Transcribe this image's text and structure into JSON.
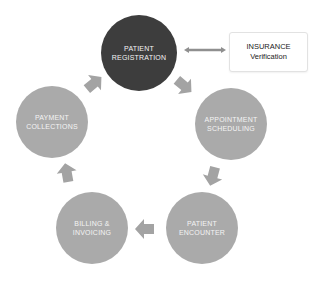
{
  "diagram": {
    "type": "cycle",
    "nodes": [
      {
        "id": "registration",
        "line1": "PATIENT",
        "line2": "REGISTRATION",
        "style": "dark",
        "color": "#3d3d3d"
      },
      {
        "id": "appointment",
        "line1": "APPOINTMENT",
        "line2": "SCHEDULING",
        "style": "light",
        "color": "#aaaaaa"
      },
      {
        "id": "encounter",
        "line1": "PATIENT",
        "line2": "ENCOUNTER",
        "style": "light",
        "color": "#aaaaaa"
      },
      {
        "id": "billing",
        "line1": "BILLING &",
        "line2": "INVOICING",
        "style": "light",
        "color": "#aaaaaa"
      },
      {
        "id": "payment",
        "line1": "PAYMENT",
        "line2": "COLLECTIONS",
        "style": "light",
        "color": "#aaaaaa"
      }
    ],
    "side_box": {
      "line1": "INSURANCE",
      "line2": "Verification"
    },
    "edges": [
      {
        "from": "registration",
        "to": "appointment"
      },
      {
        "from": "appointment",
        "to": "encounter"
      },
      {
        "from": "encounter",
        "to": "billing"
      },
      {
        "from": "billing",
        "to": "payment"
      },
      {
        "from": "payment",
        "to": "registration"
      },
      {
        "from": "registration",
        "to": "side_box",
        "bidirectional": true
      }
    ],
    "arrow_color": "#a3a3a3"
  }
}
